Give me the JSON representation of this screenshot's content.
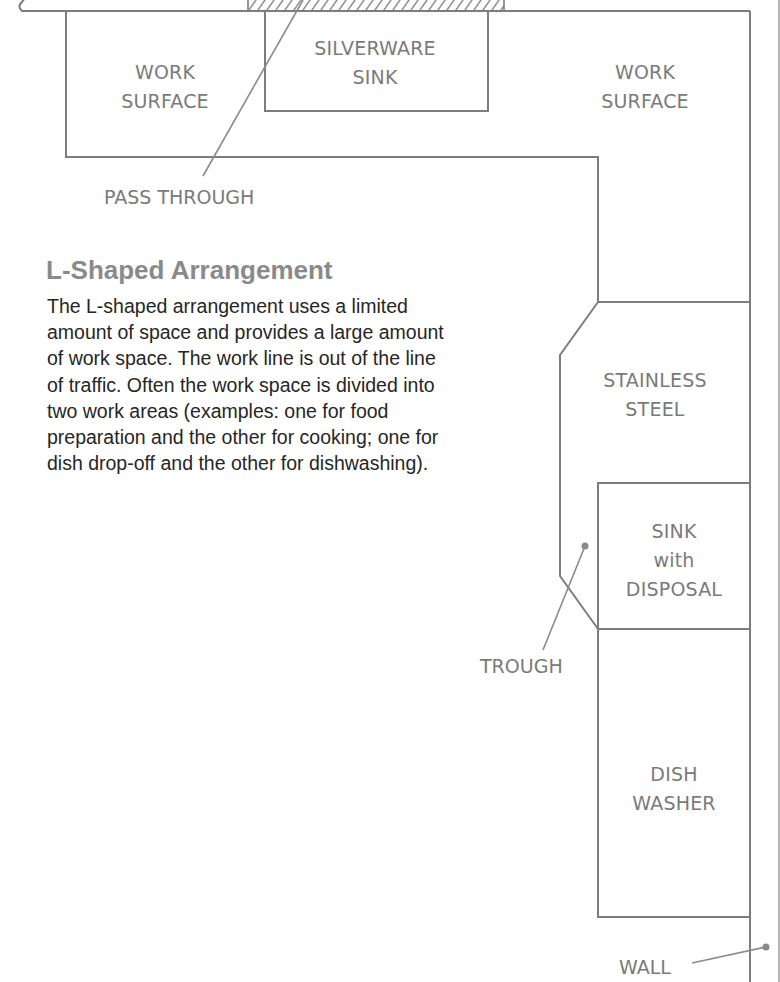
{
  "diagram": {
    "title": "L-Shaped Arrangement",
    "description": "The L-shaped arrangement uses a limited amount of space and provides a large amount of work space. The work line is out of the line of traffic. Often the work space is divided into two work areas (examples: one for food preparation and the other for cooking; one for dish drop-off and the other for dishwashing).",
    "colors": {
      "line": "#7d7d7d",
      "label": "#7a7a7a",
      "heading": "#8a8a8a",
      "body": "#262626"
    },
    "stations": [
      {
        "id": "work-surface-left",
        "label": "WORK\nSURFACE"
      },
      {
        "id": "silverware-sink",
        "label": "SILVERWARE\nSINK"
      },
      {
        "id": "work-surface-right",
        "label": "WORK\nSURFACE"
      },
      {
        "id": "stainless-steel",
        "label": "STAINLESS\nSTEEL"
      },
      {
        "id": "sink-with-disposal",
        "label": "SINK\nwith\nDISPOSAL"
      },
      {
        "id": "dish-washer",
        "label": "DISH\nWASHER"
      }
    ],
    "callouts": [
      {
        "id": "pass-through",
        "label": "PASS THROUGH"
      },
      {
        "id": "trough",
        "label": "TROUGH"
      },
      {
        "id": "wall",
        "label": "WALL"
      }
    ]
  }
}
